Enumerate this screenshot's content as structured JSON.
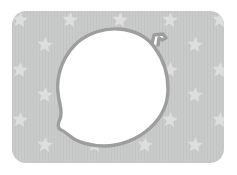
{
  "illustration": {
    "title": "Acorn shape on starred background",
    "canvas": {
      "width": 237,
      "height": 175,
      "background_color": "#ffffff"
    },
    "background_panel": {
      "name": "rounded-gray-panel",
      "x": 12,
      "y": 11,
      "width": 212,
      "height": 152,
      "corner_radius": 14,
      "fill_color": "#c9cbca",
      "stripe_color": "#c3c5c4",
      "stripe_width": 1,
      "stripe_spacing": 3
    },
    "star_pattern": {
      "name": "star-tile-pattern",
      "glyph": "star-icon",
      "points": 5,
      "fill_color": "#dddedd",
      "star_radius": 8,
      "tile_width": 50,
      "tile_height": 25,
      "stagger_offset": 25,
      "rotation_degrees": 6,
      "positions": [
        [
          20,
          20
        ],
        [
          70,
          20
        ],
        [
          120,
          20
        ],
        [
          170,
          20
        ],
        [
          220,
          20
        ],
        [
          45,
          45
        ],
        [
          95,
          45
        ],
        [
          145,
          45
        ],
        [
          195,
          45
        ],
        [
          20,
          70
        ],
        [
          70,
          70
        ],
        [
          120,
          70
        ],
        [
          170,
          70
        ],
        [
          220,
          70
        ],
        [
          45,
          95
        ],
        [
          95,
          95
        ],
        [
          145,
          95
        ],
        [
          195,
          95
        ],
        [
          20,
          120
        ],
        [
          70,
          120
        ],
        [
          120,
          120
        ],
        [
          170,
          120
        ],
        [
          220,
          120
        ],
        [
          45,
          145
        ],
        [
          95,
          145
        ],
        [
          145,
          145
        ],
        [
          195,
          145
        ]
      ]
    },
    "foreground_shape": {
      "name": "acorn-body",
      "description": "rounded irregular blob resembling an acorn or gourd",
      "fill_color": "#ffffff",
      "stroke_color": "#9e9e9e",
      "stroke_width": 3.4,
      "bounds": {
        "x": 57,
        "y": 27,
        "width": 113,
        "height": 120
      },
      "path": "M 118 29 C 136 30 148 38 155 48 C 163 59 168 74 168 89 C 168 104 161 118 150 128 C 138 139 121 146 104 146 C 90 146 77 142 70 136 C 66 133 64 131 61 130 C 57 128 58 123 60 119 C 62 114 61 109 60 104 C 58 96 57 88 58 80 C 60 66 67 52 78 42 C 89 33 104 28 118 29 Z"
    },
    "stem": {
      "name": "acorn-stem",
      "description": "small hooked stem at upper right",
      "stroke_color": "#9e9e9e",
      "stroke_width": 3.4,
      "fill_color": "#ffffff",
      "path": "M 152 44 L 154 35 L 163 34 L 166 38 L 162 40 L 159 38 L 158 45"
    }
  }
}
